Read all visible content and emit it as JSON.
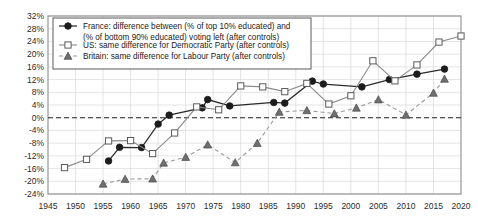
{
  "chart_data": {
    "type": "line",
    "title": "",
    "xlabel": "",
    "ylabel": "",
    "xlim": [
      1945,
      2020
    ],
    "ylim": [
      -24,
      32
    ],
    "grid": true,
    "legend_position": "top-left",
    "x_ticks": [
      1945,
      1950,
      1955,
      1960,
      1965,
      1970,
      1975,
      1980,
      1985,
      1990,
      1995,
      2000,
      2005,
      2010,
      2015,
      2020
    ],
    "y_ticks": [
      32,
      28,
      24,
      20,
      16,
      12,
      8,
      4,
      0,
      -4,
      -8,
      -12,
      -16,
      -20,
      -24
    ],
    "y_tick_labels": [
      "32%",
      "28%",
      "24%",
      "20%",
      "16%",
      "12%",
      "8%",
      "4%",
      "0%",
      "-4%",
      "-8%",
      "-12%",
      "-16%",
      "-20%",
      "-24%"
    ],
    "x_tick_labels": [
      "1945",
      "1950",
      "1955",
      "1960",
      "1965",
      "1970",
      "1975",
      "1980",
      "1985",
      "1990",
      "1995",
      "2000",
      "2005",
      "2010",
      "2015",
      "2020"
    ],
    "zero_reference_line": 0,
    "series": [
      {
        "name": "france",
        "legend_label": "France: difference between (% of top 10% educated) and (% of bottom 90% educated) voting left (after controls)",
        "marker": "filled-circle",
        "line_style": "solid",
        "color": "#1c1c1c",
        "points": [
          [
            1956,
            -13.6
          ],
          [
            1958,
            -9.3
          ],
          [
            1962,
            -9.4
          ],
          [
            1965,
            -2.0
          ],
          [
            1967,
            0.8
          ],
          [
            1973,
            3.1
          ],
          [
            1974,
            5.7
          ],
          [
            1978,
            3.7
          ],
          [
            1986,
            4.8
          ],
          [
            1988,
            4.6
          ],
          [
            1993,
            11.5
          ],
          [
            1995,
            10.6
          ],
          [
            2002,
            9.7
          ],
          [
            2007,
            12.0
          ],
          [
            2012,
            13.7
          ],
          [
            2017,
            15.3
          ]
        ]
      },
      {
        "name": "us",
        "legend_label": "US: same difference for Democratic Party (after controls)",
        "marker": "open-square",
        "line_style": "solid",
        "color": "#8a8a8a",
        "points": [
          [
            1948,
            -15.7
          ],
          [
            1952,
            -13.1
          ],
          [
            1956,
            -7.3
          ],
          [
            1960,
            -7.2
          ],
          [
            1964,
            -11.3
          ],
          [
            1968,
            -4.8
          ],
          [
            1972,
            3.4
          ],
          [
            1976,
            2.5
          ],
          [
            1980,
            10.0
          ],
          [
            1984,
            9.7
          ],
          [
            1988,
            8.2
          ],
          [
            1992,
            10.8
          ],
          [
            1996,
            4.3
          ],
          [
            2000,
            6.9
          ],
          [
            2004,
            17.9
          ],
          [
            2008,
            11.6
          ],
          [
            2012,
            16.6
          ],
          [
            2016,
            23.8
          ],
          [
            2020,
            25.7
          ]
        ]
      },
      {
        "name": "britain",
        "legend_label": "Britain: same difference for Labour Party (after controls)",
        "marker": "filled-triangle",
        "line_style": "dashed",
        "color": "#8a8a8a",
        "points": [
          [
            1955,
            -20.8
          ],
          [
            1959,
            -19.3
          ],
          [
            1964,
            -19.2
          ],
          [
            1966,
            -14.2
          ],
          [
            1970,
            -12.4
          ],
          [
            1974,
            -8.5
          ],
          [
            1979,
            -14.1
          ],
          [
            1983,
            -8.0
          ],
          [
            1987,
            1.8
          ],
          [
            1992,
            2.3
          ],
          [
            1997,
            1.3
          ],
          [
            2001,
            3.1
          ],
          [
            2005,
            5.7
          ],
          [
            2010,
            0.9
          ],
          [
            2015,
            7.8
          ],
          [
            2017,
            12.2
          ]
        ]
      }
    ]
  },
  "legend": {
    "entries": [
      {
        "key": "france",
        "line1": "France: difference between (% of top 10% educated) and",
        "line2": "(% of bottom 90% educated) voting left (after controls)"
      },
      {
        "key": "us",
        "line1": "US: same difference for Democratic Party (after controls)",
        "line2": ""
      },
      {
        "key": "britain",
        "line1": "Britain: same difference for Labour Party (after controls)",
        "line2": ""
      }
    ]
  }
}
